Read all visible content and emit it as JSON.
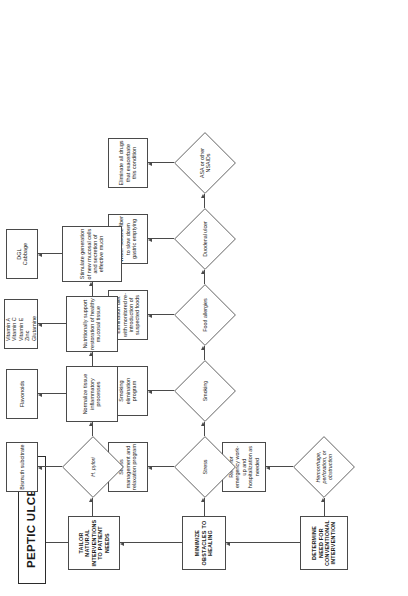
{
  "diagram": {
    "title": "PEPTIC ULCERS",
    "orientation": "rotated-90-ccw",
    "stages": [
      {
        "id": "determine",
        "label": "DETERMINE NEED FOR CONVENTIONAL INTERVENTION"
      },
      {
        "id": "minimize",
        "label": "MINIMIZE OBSTACLES TO HEALING"
      },
      {
        "id": "tailor",
        "label": "TAILOR NATURAL INTERVENTIONS TO PATIENT NEEDS"
      }
    ],
    "conventional": {
      "decision": "Hemorrhage, perforation, or obstruction",
      "action": "Refer for emergency work-up and hospitalization as needed"
    },
    "obstacles": [
      {
        "decision": "Stress",
        "action": "Stress management and relaxation program"
      },
      {
        "decision": "Smoking",
        "action": "Smoking elimination program"
      },
      {
        "decision": "Food allergies",
        "action": "Elimination diet with monitored re-introduction of suspected foods"
      },
      {
        "decision": "Duodenal ulcer",
        "action": "Water-soluble fiber to slow down gastric emptying"
      },
      {
        "decision": "ASA or other NSAIDs",
        "action": "Eliminate all drugs that exacerbate this condition"
      }
    ],
    "natural": {
      "decision": "H. pylori",
      "decision_treatment": "Bismuth subcitrate",
      "goals": [
        {
          "goal": "Normalize tissue inflammatory processes",
          "treatment": "Flavonoids"
        },
        {
          "goal": "Nutritionally support restoration of healthy mucosal tissue",
          "treatment": "Vitamin A\nVitamin C\nVitamin E\nZinc\nGlutamine"
        },
        {
          "goal": "Stimulate generation of new mucosal cells and secretion of effective mucin",
          "treatment": "DGL\nCabbage"
        }
      ]
    },
    "colors": {
      "stroke": "#4a4a4a",
      "text": "#1a1a1a",
      "background": "#ffffff"
    }
  }
}
